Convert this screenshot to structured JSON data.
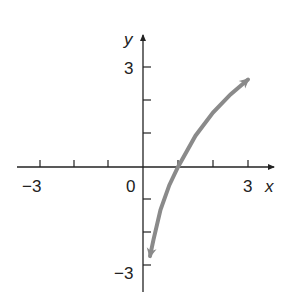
{
  "chart_data": {
    "type": "line",
    "title": "",
    "xlabel": "x",
    "ylabel": "y",
    "xlim": [
      -3.5,
      3.5
    ],
    "ylim": [
      -3.5,
      3.5
    ],
    "grid": false,
    "x_tick_labels": [
      {
        "value": -3,
        "label": "−3"
      },
      {
        "value": 0,
        "label": "0"
      },
      {
        "value": 3,
        "label": "3"
      }
    ],
    "y_tick_labels": [
      {
        "value": 3,
        "label": "3"
      },
      {
        "value": -3,
        "label": "−3"
      }
    ],
    "x_ticks": [
      -3,
      -2,
      -1,
      1,
      2,
      3
    ],
    "y_ticks": [
      -3,
      -2,
      -1,
      1,
      2,
      3
    ],
    "series": [
      {
        "name": "curve",
        "color": "#8a8a8a",
        "arrows_both_ends": true,
        "x": [
          0.2,
          0.3,
          0.5,
          0.75,
          1.0,
          1.5,
          2.0,
          2.5,
          3.0
        ],
        "y": [
          -2.7,
          -2.2,
          -1.3,
          -0.55,
          0.0,
          0.95,
          1.65,
          2.2,
          2.65
        ]
      }
    ]
  },
  "labels": {
    "x_axis": "x",
    "y_axis": "y",
    "x_neg3": "−3",
    "origin": "0",
    "x_pos3": "3",
    "y_pos3": "3",
    "y_neg3": "−3"
  }
}
